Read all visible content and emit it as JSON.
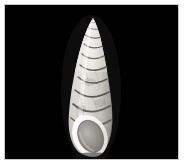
{
  "image": {
    "kind": "specimen-photograph",
    "subject": "gastropod-shell",
    "orientation": "apertural view, apex up",
    "background_color": "#000000",
    "page_color": "#ffffff",
    "frame": {
      "left": 5,
      "top": 5,
      "width": 173,
      "height": 154
    },
    "caption": ""
  },
  "specimen": {
    "form": "high-spired turreted shell",
    "whorl_count": 12,
    "apex": {
      "x": 88,
      "y": 13,
      "shape": "rounded-point"
    },
    "aperture": {
      "shape": "oval",
      "center_x": 85,
      "center_y": 131,
      "rim_color": "#f4f2ee",
      "interior_color": "#8e8c88"
    },
    "colors": {
      "shell_light": "#e8e6e0",
      "shell_mid": "#c9c6bf",
      "shell_shadow": "#8a8781",
      "suture_line": "#4a4742",
      "highlight": "#fbfaf7"
    },
    "tilt_degrees": 6,
    "widest_point_y": 110
  }
}
